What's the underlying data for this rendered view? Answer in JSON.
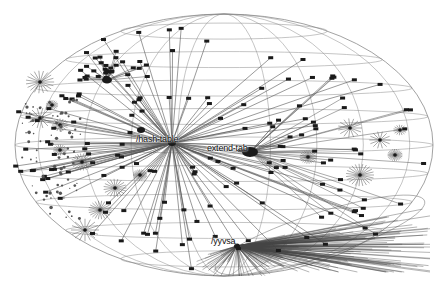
{
  "diagram": {
    "type": "hyperbolic-graph-sphere",
    "colors": {
      "background": "#ffffff",
      "edge": "#555555",
      "grid": "#8a8a8a",
      "node": "#1a1a1a"
    },
    "sphere": {
      "cx": 224,
      "cy": 145,
      "rx": 209,
      "ry": 131
    },
    "labels": [
      {
        "id": "hash-table",
        "text": "/hash-table",
        "x": 136,
        "y": 134
      },
      {
        "id": "extend-tab",
        "text": "extend-tab",
        "x": 207,
        "y": 143
      },
      {
        "id": "yyvsa",
        "text": "/yyvsa",
        "x": 211,
        "y": 236
      }
    ],
    "hubs": [
      {
        "name": "hash-table",
        "x": 172,
        "y": 143
      },
      {
        "name": "extend-tab",
        "x": 250,
        "y": 152
      },
      {
        "name": "yyvsa",
        "x": 237,
        "y": 246
      },
      {
        "name": "top-left-cluster",
        "x": 107,
        "y": 80
      }
    ]
  }
}
